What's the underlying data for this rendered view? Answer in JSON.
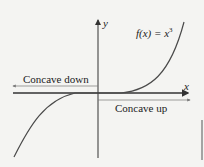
{
  "diagram": {
    "function_label": "f(x) = x",
    "function_exponent": "3",
    "x_axis_label": "x",
    "y_axis_label": "y",
    "left_region_label": "Concave down",
    "right_region_label": "Concave up",
    "colors": {
      "curve": "#4a4a4a",
      "axis": "#333333",
      "background": "#f4f4f2"
    }
  }
}
